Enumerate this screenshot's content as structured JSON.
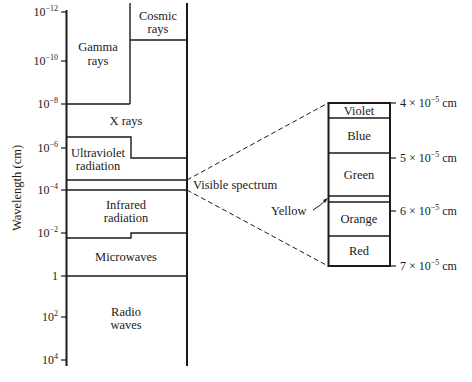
{
  "diagram": {
    "y_axis": {
      "label": "Wavelength (cm)",
      "ticks": [
        {
          "base": "10",
          "exp": "−12",
          "y": 12
        },
        {
          "base": "10",
          "exp": "−10",
          "y": 61
        },
        {
          "base": "10",
          "exp": "−8",
          "y": 104
        },
        {
          "base": "10",
          "exp": "−6",
          "y": 148
        },
        {
          "base": "10",
          "exp": "−4",
          "y": 190
        },
        {
          "base": "10",
          "exp": "−2",
          "y": 233
        },
        {
          "base": "1",
          "exp": "",
          "y": 276
        },
        {
          "base": "10",
          "exp": "2",
          "y": 317
        },
        {
          "base": "10",
          "exp": "4",
          "y": 360
        }
      ]
    },
    "bands": [
      {
        "name": "cosmic-rays",
        "line1": "Cosmic",
        "line2": "rays"
      },
      {
        "name": "gamma-rays",
        "line1": "Gamma",
        "line2": "rays"
      },
      {
        "name": "x-rays",
        "line1": "X rays",
        "line2": ""
      },
      {
        "name": "ultraviolet",
        "line1": "Ultraviolet",
        "line2": "radiation"
      },
      {
        "name": "infrared",
        "line1": "Infrared",
        "line2": "radiation"
      },
      {
        "name": "microwaves",
        "line1": "Microwaves",
        "line2": ""
      },
      {
        "name": "radio-waves",
        "line1": "Radio",
        "line2": "waves"
      }
    ],
    "visible_label": "Visible spectrum",
    "visible_inset": {
      "colors": [
        "Violet",
        "Blue",
        "Green",
        "Yellow",
        "Orange",
        "Red"
      ],
      "yellow_callout": "Yellow",
      "scale": [
        {
          "mant": "4",
          "exp": "−5",
          "unit": "cm"
        },
        {
          "mant": "5",
          "exp": "−5",
          "unit": "cm"
        },
        {
          "mant": "6",
          "exp": "−5",
          "unit": "cm"
        },
        {
          "mant": "7",
          "exp": "−5",
          "unit": "cm"
        }
      ]
    }
  }
}
